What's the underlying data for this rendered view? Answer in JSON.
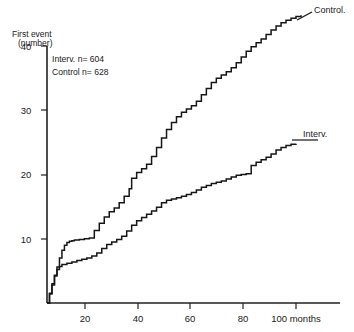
{
  "chart_data": {
    "type": "line",
    "title": "",
    "subtitle": "",
    "xlabel": "months",
    "ylabel": "First event (number)",
    "ylabel_line1": "First event",
    "ylabel_line2": "(number)",
    "xlim": [
      0,
      104
    ],
    "ylim": [
      0,
      40
    ],
    "grid": false,
    "legend_position": "curve-end-labels",
    "xticks": [
      20,
      40,
      60,
      80,
      100
    ],
    "xtick_labels": [
      "20",
      "40",
      "60",
      "80",
      "100"
    ],
    "x_units_label": "100 months",
    "yticks": [
      10,
      20,
      30,
      40
    ],
    "ytick_labels": [
      "10",
      "20",
      "30",
      "40"
    ],
    "annotations": [
      {
        "name": "interv-count",
        "text": "Interv.  n= 604"
      },
      {
        "name": "control-count",
        "text": "Control n= 628"
      }
    ],
    "annotation_interv": "Interv.  n= 604",
    "annotation_control": "Control n= 628",
    "series": [
      {
        "name": "Control",
        "label": "Control.",
        "n": 628,
        "step": true,
        "x": [
          0,
          1,
          2,
          3,
          4,
          5,
          6,
          7,
          8,
          9,
          10,
          11,
          13,
          15,
          17,
          19,
          21,
          23,
          25,
          27,
          29,
          31,
          33,
          34,
          36,
          38,
          40,
          42,
          44,
          46,
          48,
          50,
          52,
          54,
          56,
          58,
          60,
          62,
          64,
          66,
          68,
          70,
          72,
          74,
          76,
          78,
          80,
          82,
          84,
          86,
          88,
          90,
          92,
          94,
          96,
          98,
          100,
          102
        ],
        "y": [
          0,
          1.4,
          2.8,
          4.2,
          5.6,
          7.0,
          8.2,
          9.0,
          9.4,
          9.6,
          9.7,
          9.8,
          9.9,
          10.0,
          10.1,
          11.3,
          12.4,
          13.4,
          14.2,
          14.8,
          15.6,
          16.6,
          17.8,
          19.4,
          20.3,
          20.9,
          21.6,
          22.8,
          24.2,
          25.7,
          27.0,
          28.1,
          29.0,
          29.7,
          30.2,
          30.7,
          31.4,
          32.4,
          33.4,
          34.3,
          35.0,
          35.5,
          36.0,
          36.6,
          37.4,
          38.3,
          39.2,
          39.9,
          40.5,
          41.1,
          41.8,
          42.5,
          43.1,
          43.6,
          44.0,
          44.3,
          44.6,
          44.8
        ]
      },
      {
        "name": "Interv.",
        "label": "Interv.",
        "n": 604,
        "step": true,
        "x": [
          0,
          1,
          2,
          3,
          4,
          5,
          6,
          8,
          10,
          12,
          14,
          16,
          18,
          20,
          22,
          24,
          26,
          28,
          30,
          32,
          34,
          36,
          38,
          40,
          42,
          44,
          46,
          48,
          50,
          52,
          54,
          56,
          58,
          60,
          62,
          64,
          66,
          68,
          70,
          72,
          74,
          76,
          78,
          80,
          82,
          84,
          86,
          88,
          90,
          92,
          94,
          96,
          98,
          100
        ],
        "y": [
          0,
          1.5,
          3.0,
          4.3,
          5.2,
          5.7,
          6.0,
          6.2,
          6.4,
          6.6,
          6.8,
          7.0,
          7.3,
          7.8,
          8.5,
          9.1,
          9.5,
          9.9,
          10.4,
          11.2,
          12.1,
          12.8,
          13.3,
          13.8,
          14.3,
          14.9,
          15.6,
          16.0,
          16.2,
          16.4,
          16.6,
          16.9,
          17.2,
          17.6,
          18.0,
          18.3,
          18.6,
          18.8,
          19.0,
          19.3,
          19.6,
          19.9,
          20.0,
          20.1,
          21.4,
          21.9,
          22.3,
          22.7,
          23.2,
          23.8,
          24.2,
          24.5,
          24.7,
          24.8
        ]
      }
    ]
  },
  "colors": {
    "ink": "#161616",
    "axis": "#202020",
    "background": "#ffffff"
  }
}
